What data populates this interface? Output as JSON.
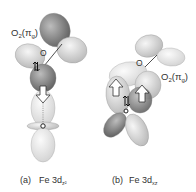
{
  "panels": [
    {
      "id": "a",
      "ligand_label": "O",
      "ligand_sub": "2",
      "ligand_orbital": "π",
      "ligand_orbital_sub": "g",
      "atom_label": "O",
      "caption_letter": "(a)",
      "caption_metal": "Fe 3d",
      "caption_sub": "z²"
    },
    {
      "id": "b",
      "ligand_label": "O",
      "ligand_sub": "2",
      "ligand_orbital": "π",
      "ligand_orbital_sub": "g",
      "atom_label": "O",
      "caption_letter": "(b)",
      "caption_metal": "Fe 3d",
      "caption_sub": "xz"
    }
  ],
  "colors": {
    "dark_lobe": "#7a7a7a",
    "light_lobe": "#d9d9d9",
    "pale_lobe": "#ececec",
    "text": "#333333"
  }
}
